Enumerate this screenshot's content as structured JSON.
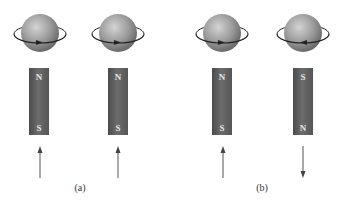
{
  "figure": {
    "units": [
      {
        "id": "a1",
        "spin_direction": "counterclockwise-front-right",
        "magnet_top": "N",
        "magnet_bottom": "S",
        "arrow": "up",
        "cx": 40
      },
      {
        "id": "a2",
        "spin_direction": "counterclockwise-front-right",
        "magnet_top": "N",
        "magnet_bottom": "S",
        "arrow": "up",
        "cx": 118
      },
      {
        "id": "b1",
        "spin_direction": "counterclockwise-front-right",
        "magnet_top": "N",
        "magnet_bottom": "S",
        "arrow": "up",
        "cx": 222
      },
      {
        "id": "b2",
        "spin_direction": "clockwise-front-left",
        "magnet_top": "S",
        "magnet_bottom": "N",
        "arrow": "down",
        "cx": 303
      }
    ],
    "captions": [
      {
        "label": "(a)",
        "x": 80
      },
      {
        "label": "(b)",
        "x": 262
      }
    ]
  },
  "colors": {
    "sphere_light": "#c8c8c8",
    "sphere_dark": "#6e6e6e",
    "magnet": "#5e5e5e",
    "ring": "#222222",
    "arrow": "#555555"
  }
}
